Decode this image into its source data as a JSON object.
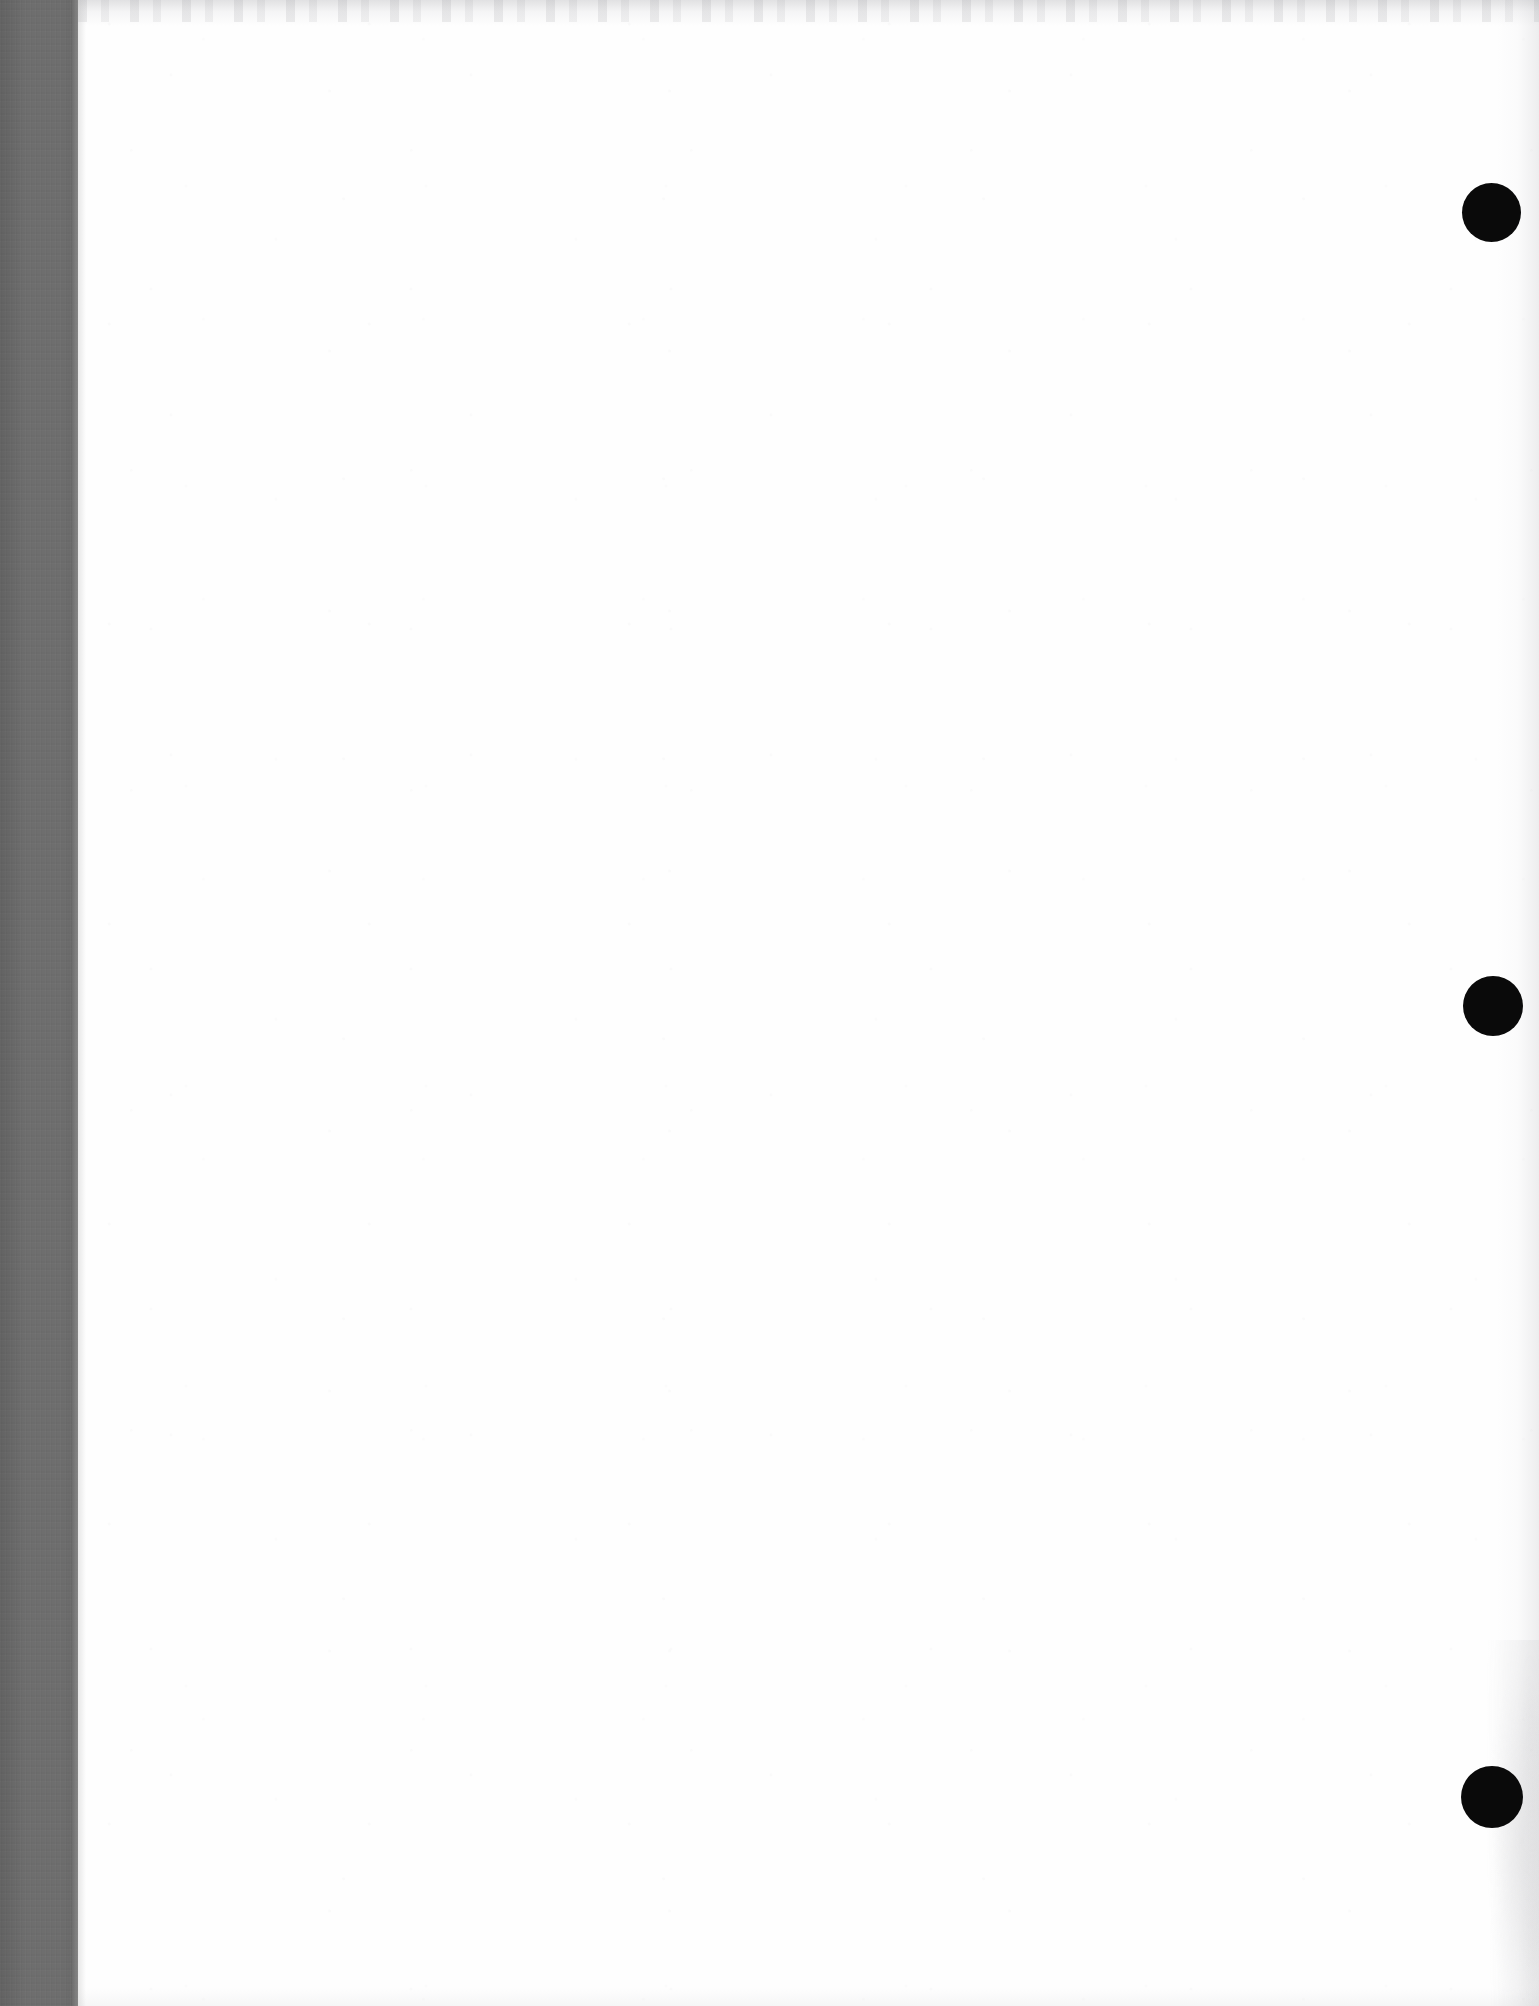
{
  "document": {
    "kind": "scanned-page",
    "page_state": "blank",
    "visible_text": "",
    "page_width_px": 1539,
    "page_height_px": 2006,
    "paper_color": "#fefefe"
  },
  "gutter": {
    "name": "left-scanner-gutter-band",
    "color": "#6e6e6e",
    "left_px": 0,
    "top_px": 0,
    "width_px": 78,
    "height_px": 2006
  },
  "artifacts": {
    "top_edge": {
      "name": "top-scan-edge-mottle",
      "color": "#9a9a9f"
    },
    "right_edge": {
      "name": "right-margin-shadow",
      "color": "#a0a0a5"
    },
    "bottom_edge": {
      "name": "bottom-scan-edge-fade",
      "color": "#b9b9be"
    }
  },
  "binding_marks": {
    "color": "#0a0a0a",
    "count": 3,
    "items": [
      {
        "name": "binding-mark-top",
        "center_x": 1491,
        "center_y": 212,
        "diameter": 59
      },
      {
        "name": "binding-mark-middle",
        "center_x": 1493,
        "center_y": 1006,
        "diameter": 60
      },
      {
        "name": "binding-mark-bottom",
        "center_x": 1492,
        "center_y": 1797,
        "diameter": 62
      }
    ]
  }
}
